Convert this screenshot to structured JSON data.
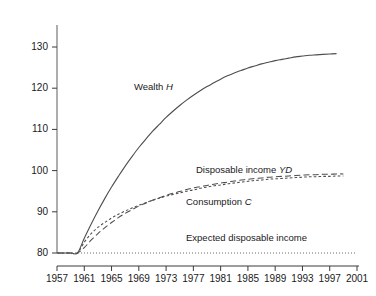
{
  "chart_data": {
    "type": "line",
    "title": "",
    "subtitle": "",
    "xlabel": "",
    "ylabel": "",
    "xlim": [
      1957,
      2001
    ],
    "ylim": [
      78,
      134
    ],
    "grid": false,
    "legend_position": "inline-annotations",
    "xticks": [
      "1957",
      "1961",
      "1965",
      "1969",
      "1973",
      "1977",
      "1981",
      "1985",
      "1989",
      "1993",
      "1997",
      "2001"
    ],
    "xtick_values": [
      1957,
      1961,
      1965,
      1969,
      1973,
      1977,
      1981,
      1985,
      1989,
      1993,
      1997,
      2001
    ],
    "yticks": [
      "80",
      "90",
      "100",
      "110",
      "120",
      "130"
    ],
    "ytick_values": [
      80,
      90,
      100,
      110,
      120,
      130
    ],
    "series": [
      {
        "name": "Wealth H",
        "label_text": "Wealth ",
        "label_italic": "H",
        "style": "solid",
        "color": "#4d4d4d",
        "x": [
          1957,
          1958,
          1959,
          1960,
          1961,
          1962,
          1963,
          1964,
          1965,
          1966,
          1967,
          1968,
          1969,
          1970,
          1971,
          1972,
          1973,
          1974,
          1975,
          1976,
          1977,
          1978,
          1979,
          1980,
          1981,
          1982,
          1983,
          1984,
          1985,
          1986,
          1987,
          1988,
          1989,
          1990,
          1991,
          1992,
          1993,
          1994,
          1995,
          1996,
          1997,
          1998
        ],
        "values": [
          80.0,
          80.0,
          80.0,
          80.0,
          83.6,
          87.0,
          90.2,
          93.2,
          96.0,
          98.6,
          101.1,
          103.4,
          105.6,
          107.6,
          109.5,
          111.2,
          112.9,
          114.4,
          115.8,
          117.1,
          118.3,
          119.4,
          120.4,
          121.3,
          122.2,
          123.0,
          123.7,
          124.3,
          124.9,
          125.4,
          125.9,
          126.3,
          126.7,
          127.0,
          127.3,
          127.6,
          127.8,
          128.0,
          128.1,
          128.2,
          128.3,
          128.4
        ]
      },
      {
        "name": "Disposable income YD",
        "label_text": "Disposable income ",
        "label_italic": "YD",
        "style": "dashed",
        "color": "#4d4d4d",
        "x": [
          1957,
          1958,
          1959,
          1960,
          1961,
          1962,
          1963,
          1964,
          1965,
          1966,
          1967,
          1968,
          1969,
          1970,
          1971,
          1972,
          1973,
          1974,
          1975,
          1976,
          1977,
          1978,
          1979,
          1980,
          1981,
          1982,
          1983,
          1984,
          1985,
          1986,
          1987,
          1988,
          1989,
          1990,
          1991,
          1992,
          1993,
          1994,
          1995,
          1996,
          1997,
          1998,
          1999
        ],
        "values": [
          80.0,
          80.0,
          80.0,
          80.0,
          81.3,
          83.1,
          84.7,
          86.1,
          87.4,
          88.6,
          89.6,
          90.5,
          91.4,
          92.1,
          92.8,
          93.4,
          94.0,
          94.5,
          94.9,
          95.4,
          95.8,
          96.1,
          96.4,
          96.7,
          97.0,
          97.2,
          97.5,
          97.7,
          97.9,
          98.1,
          98.2,
          98.4,
          98.5,
          98.6,
          98.7,
          98.8,
          98.9,
          99.0,
          99.0,
          99.1,
          99.1,
          99.2,
          99.2
        ]
      },
      {
        "name": "Consumption C",
        "label_text": "Consumption ",
        "label_italic": "C",
        "style": "dotted",
        "color": "#4d4d4d",
        "x": [
          1957,
          1958,
          1959,
          1960,
          1961,
          1962,
          1963,
          1964,
          1965,
          1966,
          1967,
          1968,
          1969,
          1970,
          1971,
          1972,
          1973,
          1974,
          1975,
          1976,
          1977,
          1978,
          1979,
          1980,
          1981,
          1982,
          1983,
          1984,
          1985,
          1986,
          1987,
          1988,
          1989,
          1990,
          1991,
          1992,
          1993,
          1994,
          1995,
          1996,
          1997,
          1998,
          1999
        ],
        "values": [
          80.0,
          80.0,
          80.0,
          80.0,
          82.6,
          84.7,
          86.2,
          87.4,
          88.5,
          89.4,
          90.2,
          90.9,
          91.6,
          92.2,
          92.8,
          93.3,
          93.8,
          94.2,
          94.6,
          95.0,
          95.3,
          95.7,
          96.0,
          96.3,
          96.5,
          96.8,
          97.0,
          97.2,
          97.4,
          97.6,
          97.7,
          97.9,
          98.0,
          98.1,
          98.2,
          98.3,
          98.4,
          98.5,
          98.5,
          98.6,
          98.6,
          98.7,
          98.7
        ]
      },
      {
        "name": "Expected disposable income",
        "label_text": "Expected disposable income",
        "label_italic": "",
        "style": "fine-dotted",
        "color": "#6e6e6e",
        "x": [
          1957,
          2001
        ],
        "values": [
          80.0,
          80.0
        ]
      }
    ],
    "annotations": [
      {
        "text": "Wealth H",
        "x": 1974,
        "y": 116
      },
      {
        "text": "Disposable income YD",
        "x": 1985,
        "y": 99
      },
      {
        "text": "Consumption C",
        "x": 1982,
        "y": 93
      },
      {
        "text": "Expected disposable income",
        "x": 1983,
        "y": 82
      }
    ]
  },
  "axes": {
    "y_axis_name": "value-axis",
    "x_axis_name": "year-axis"
  }
}
